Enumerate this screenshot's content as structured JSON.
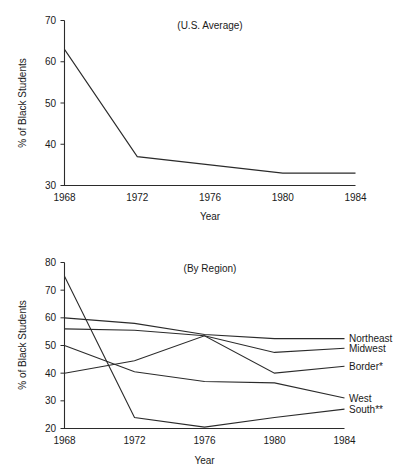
{
  "figure": {
    "clipped_header_text": "",
    "axis_titles": {
      "y": "% of Black Students",
      "x": "Year"
    }
  },
  "panels": {
    "top": {
      "title": "(U.S. Average)",
      "y_ticks": [
        "30",
        "40",
        "50",
        "60",
        "70"
      ],
      "x_ticks": [
        "1968",
        "1972",
        "1976",
        "1980",
        "1984"
      ],
      "x_title": "Year",
      "y_title": "% of Black Students"
    },
    "bottom": {
      "title": "(By Region)",
      "y_ticks": [
        "20",
        "30",
        "40",
        "50",
        "60",
        "70",
        "80"
      ],
      "x_ticks": [
        "1968",
        "1972",
        "1976",
        "1980",
        "1984"
      ],
      "x_title": "Year",
      "y_title": "% of Black Students",
      "series_labels": [
        "Northeast",
        "Midwest",
        "Border*",
        "West",
        "South**"
      ]
    }
  },
  "chart_data": [
    {
      "type": "line",
      "title": "(U.S. Average)",
      "xlabel": "Year",
      "ylabel": "% of Black Students",
      "x": [
        1968,
        1972,
        1976,
        1980,
        1984
      ],
      "xlim": [
        1968,
        1984
      ],
      "ylim": [
        30,
        70
      ],
      "ytick_values": [
        30,
        40,
        50,
        60,
        70
      ],
      "grid": false,
      "legend": "none",
      "series": [
        {
          "name": "U.S. Average",
          "values": [
            63,
            37,
            35,
            33,
            33
          ]
        }
      ]
    },
    {
      "type": "line",
      "title": "(By Region)",
      "xlabel": "Year",
      "ylabel": "% of Black Students",
      "x": [
        1968,
        1972,
        1976,
        1980,
        1984
      ],
      "xlim": [
        1968,
        1984
      ],
      "ylim": [
        20,
        80
      ],
      "ytick_values": [
        20,
        30,
        40,
        50,
        60,
        70,
        80
      ],
      "grid": false,
      "legend": "right-inline",
      "annotations": [
        "Border*",
        "South**"
      ],
      "series": [
        {
          "name": "Northeast",
          "values": [
            60,
            58,
            54,
            52.5,
            52.5
          ]
        },
        {
          "name": "Midwest",
          "values": [
            56,
            55.5,
            53.5,
            47.5,
            49
          ]
        },
        {
          "name": "Border*",
          "values": [
            40,
            44.5,
            53.5,
            40,
            42.5
          ]
        },
        {
          "name": "West",
          "values": [
            50,
            40.5,
            37,
            36.5,
            31
          ]
        },
        {
          "name": "South**",
          "values": [
            75,
            24,
            20.5,
            24,
            27
          ]
        }
      ]
    }
  ]
}
